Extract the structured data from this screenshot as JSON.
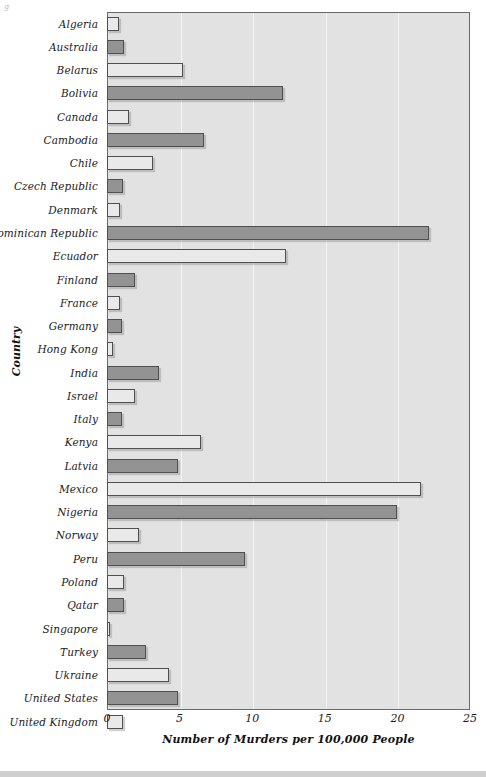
{
  "figure": {
    "corner_mark": "g",
    "y_axis_title": "Country",
    "x_axis_title": "Number of Murders per 100,000 People"
  },
  "colors": {
    "bar_dark": "#939393",
    "bar_light": "#e9e9e9",
    "bar_outline": "#4f4f4f",
    "plot_background": "#e2e2e2",
    "gridline": "#f4f4f4",
    "text": "#1b1b1b"
  },
  "chart_data": {
    "type": "bar",
    "orientation": "horizontal",
    "title": "",
    "subtitle": "",
    "xlabel": "Number of Murders per 100,000 People",
    "ylabel": "Country",
    "xlim": [
      0,
      25
    ],
    "ylim": null,
    "xticks": [
      0,
      5,
      10,
      15,
      20,
      25
    ],
    "xtick_labels": [
      "0",
      "5",
      "10",
      "15",
      "20",
      "25"
    ],
    "grid": "vertical",
    "legend": null,
    "legend_position": "none",
    "categories": [
      "Algeria",
      "Australia",
      "Belarus",
      "Bolivia",
      "Canada",
      "Cambodia",
      "Chile",
      "Czech Republic",
      "Denmark",
      "Dominican Republic",
      "Ecuador",
      "Finland",
      "France",
      "Germany",
      "Hong Kong",
      "India",
      "Israel",
      "Italy",
      "Kenya",
      "Latvia",
      "Mexico",
      "Nigeria",
      "Norway",
      "Peru",
      "Poland",
      "Qatar",
      "Singapore",
      "Turkey",
      "Ukraine",
      "United States",
      "United Kingdom"
    ],
    "values": [
      0.8,
      1.2,
      5.2,
      12.1,
      1.5,
      6.7,
      3.2,
      1.1,
      0.9,
      22.2,
      12.3,
      1.9,
      0.9,
      1.0,
      0.4,
      3.6,
      1.9,
      1.0,
      6.5,
      4.9,
      21.6,
      20.0,
      2.2,
      9.5,
      1.2,
      1.2,
      0.2,
      2.7,
      4.3,
      4.9,
      1.1
    ],
    "shades": [
      "light",
      "dark",
      "light",
      "dark",
      "light",
      "dark",
      "light",
      "dark",
      "light",
      "dark",
      "light",
      "dark",
      "light",
      "dark",
      "light",
      "dark",
      "light",
      "dark",
      "light",
      "dark",
      "light",
      "dark",
      "light",
      "dark",
      "light",
      "dark",
      "light",
      "dark",
      "light",
      "dark",
      "light"
    ]
  }
}
